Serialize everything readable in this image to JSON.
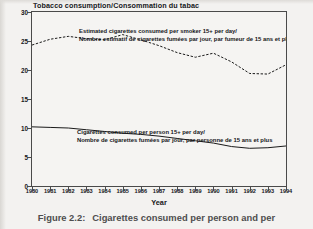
{
  "figure": {
    "caption_number": "Figure 2.2:",
    "caption_text": "Cigarettes consumed per person and per"
  },
  "chart_data": {
    "type": "line",
    "title": "Tobacco consumption/Consommation du tabac",
    "xlabel": "Year",
    "ylabel": "",
    "xlim": [
      1980,
      1994
    ],
    "ylim": [
      0,
      30
    ],
    "yticks": [
      0,
      5,
      10,
      15,
      20,
      25,
      30
    ],
    "ytick_labels": [
      "0",
      "5",
      "10",
      "15",
      "20",
      "25",
      "30"
    ],
    "x": [
      1980,
      1981,
      1982,
      1983,
      1984,
      1985,
      1986,
      1987,
      1988,
      1989,
      1990,
      1991,
      1992,
      1993,
      1994
    ],
    "xtick_labels": [
      "1980",
      "1981",
      "1982",
      "1983",
      "1984",
      "1985",
      "1986",
      "1987",
      "1988",
      "1989",
      "1990",
      "1991",
      "1992",
      "1993",
      "1994"
    ],
    "grid": false,
    "legend_position": "in-plot annotations",
    "series": [
      {
        "name": "Estimated cigarettes consumed per smoker 15+ per day",
        "style": "dashed",
        "values": [
          24.3,
          25.3,
          25.8,
          25.4,
          25.2,
          26.1,
          25.2,
          24.2,
          23.0,
          22.2,
          22.9,
          21.4,
          19.4,
          19.3,
          20.9
        ]
      },
      {
        "name": "Cigarettes consumed per person 15+ per day",
        "style": "solid",
        "values": [
          10.2,
          10.1,
          10.0,
          9.7,
          9.4,
          9.1,
          8.9,
          8.6,
          8.2,
          7.8,
          7.4,
          6.8,
          6.5,
          6.6,
          6.9
        ]
      }
    ],
    "annotations": [
      {
        "id": "upper",
        "line1": "Estimated cigarettes consumed per smoker 15+ per day/",
        "line2": "Nombre estimatif de cigarettes fumées par jour, par fumeur de 15 ans et plus"
      },
      {
        "id": "lower",
        "line1": "Cigarettes consumed per person 15+ per day/",
        "line2": "Nombre de cigarettes fumées par jour, par personne de 15 ans et plus"
      }
    ],
    "colors": {
      "line": "#1a1a1a",
      "frame": "#4a4a4a",
      "background": "#f5f4f2",
      "text": "#15161a"
    }
  }
}
